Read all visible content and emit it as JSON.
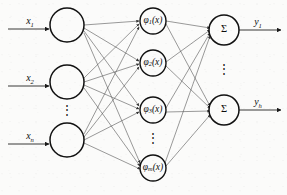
{
  "diagram": {
    "type": "neural-network",
    "background_color": "#fbfbfa",
    "node_stroke_color": "#111111",
    "edge_color": "#555555",
    "io_arrow_color": "#222222"
  },
  "layers": {
    "input": {
      "name": "input-layer",
      "nodes": [
        {
          "id": "in-1",
          "label": "",
          "cx": 67,
          "cy": 25,
          "r": 17
        },
        {
          "id": "in-2",
          "label": "",
          "cx": 67,
          "cy": 82,
          "r": 17
        },
        {
          "id": "in-3",
          "label": "",
          "cx": 67,
          "cy": 140,
          "r": 17
        }
      ],
      "ellipsis": {
        "x": 67,
        "y": 111,
        "glyph": "⋮"
      },
      "inputs": [
        {
          "id": "x1",
          "base": "x",
          "subscript": "1",
          "label": "x₁",
          "x": 30,
          "y": 25
        },
        {
          "id": "x2",
          "base": "x",
          "subscript": "2",
          "label": "x₂",
          "x": 30,
          "y": 82
        },
        {
          "id": "xn",
          "base": "x",
          "subscript": "n",
          "label": "xₙ",
          "x": 30,
          "y": 140
        }
      ]
    },
    "hidden": {
      "name": "hidden-layer",
      "nodes": [
        {
          "id": "phi-1",
          "base": "φ",
          "subscript": "1",
          "suffix": "(x)",
          "cx": 153,
          "cy": 21,
          "r": 13
        },
        {
          "id": "phi-2",
          "base": "φ",
          "subscript": "2",
          "suffix": "(x)",
          "cx": 153,
          "cy": 63,
          "r": 13
        },
        {
          "id": "phi-3",
          "base": "φ",
          "subscript": "3",
          "suffix": "(x)",
          "cx": 153,
          "cy": 110,
          "r": 13
        },
        {
          "id": "phi-m",
          "base": "φ",
          "subscript": "m",
          "suffix": "(x)",
          "cx": 153,
          "cy": 168,
          "r": 13
        }
      ],
      "ellipsis": {
        "x": 153,
        "y": 139,
        "glyph": "⋮"
      }
    },
    "output": {
      "name": "output-layer",
      "nodes": [
        {
          "id": "sum-1",
          "label": "Σ",
          "cx": 224,
          "cy": 30,
          "r": 15
        },
        {
          "id": "sum-2",
          "label": "Σ",
          "cx": 224,
          "cy": 110,
          "r": 15
        }
      ],
      "ellipsis": {
        "x": 224,
        "y": 70,
        "glyph": "⋮"
      },
      "outputs": [
        {
          "id": "y1",
          "base": "y",
          "subscript": "1",
          "label": "y₁",
          "x": 258,
          "y": 30
        },
        {
          "id": "yh",
          "base": "y",
          "subscript": "h",
          "label": "yₕ",
          "x": 258,
          "y": 110
        }
      ]
    }
  },
  "connections": {
    "input_to_hidden_fully_connected": true,
    "hidden_to_output_fully_connected": true,
    "input_count": 3,
    "hidden_count": 4,
    "output_count": 2,
    "input_to_hidden_edges": 12,
    "hidden_to_output_edges": 8
  }
}
